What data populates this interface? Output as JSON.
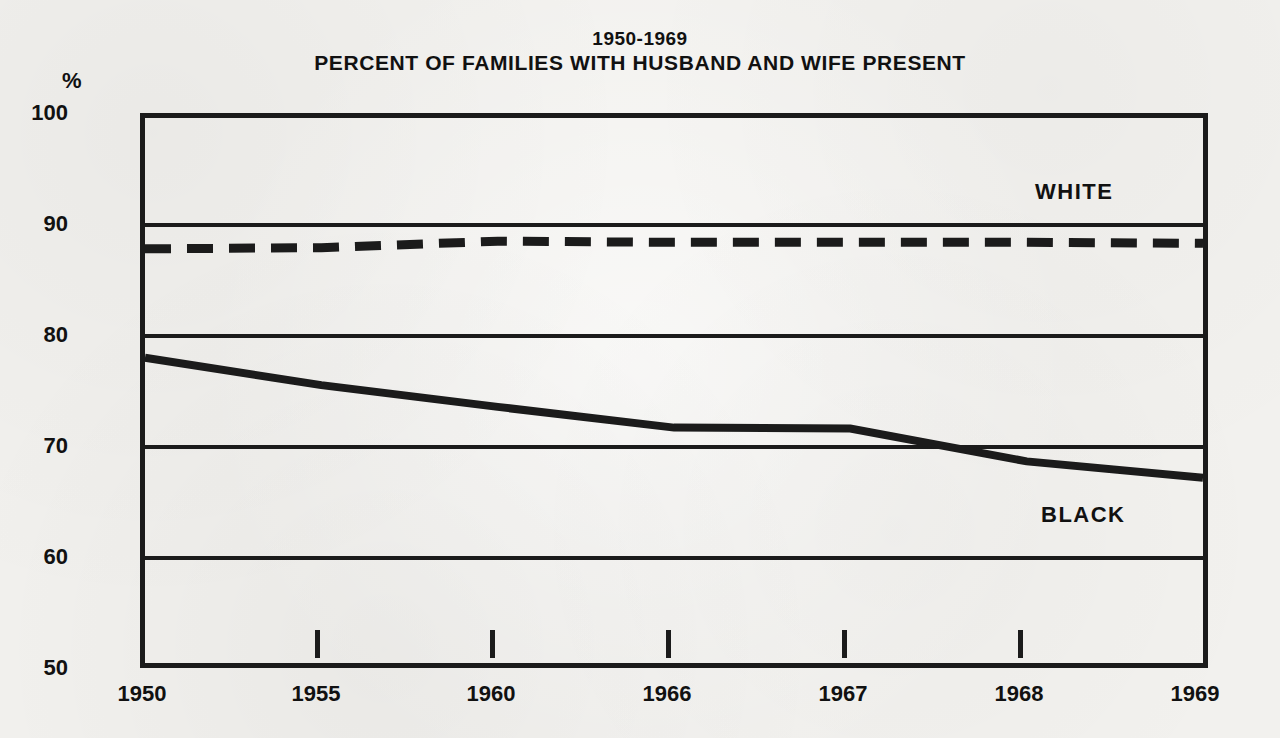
{
  "title": {
    "line1": "1950-1969",
    "line2": "PERCENT OF FAMILIES WITH HUSBAND AND WIFE PRESENT"
  },
  "axis": {
    "y_unit_symbol": "%",
    "y_ticks": [
      "100",
      "90",
      "80",
      "70",
      "60",
      "50"
    ],
    "x_ticks": [
      "1950",
      "1955",
      "1960",
      "1966",
      "1967",
      "1968",
      "1969"
    ]
  },
  "series_labels": {
    "white": "WHITE",
    "black": "BLACK"
  },
  "colors": {
    "ink": "#1b1b1b",
    "paper": "#f2f1ee"
  },
  "chart_data": {
    "type": "line",
    "title": "PERCENT OF FAMILIES WITH HUSBAND AND WIFE PRESENT",
    "subtitle": "1950-1969",
    "xlabel": "",
    "ylabel": "%",
    "ylim": [
      50,
      100
    ],
    "yticks": [
      50,
      60,
      70,
      80,
      90,
      100
    ],
    "grid": "horizontal",
    "legend": "inline-labels",
    "categories": [
      "1950",
      "1955",
      "1960",
      "1966",
      "1967",
      "1968",
      "1969"
    ],
    "series": [
      {
        "name": "WHITE",
        "style": "dashed",
        "values": [
          88.0,
          88.1,
          88.7,
          88.6,
          88.6,
          88.6,
          88.5
        ]
      },
      {
        "name": "BLACK",
        "style": "solid",
        "values": [
          78.0,
          75.5,
          73.5,
          71.6,
          71.5,
          68.5,
          67.0
        ]
      }
    ]
  }
}
